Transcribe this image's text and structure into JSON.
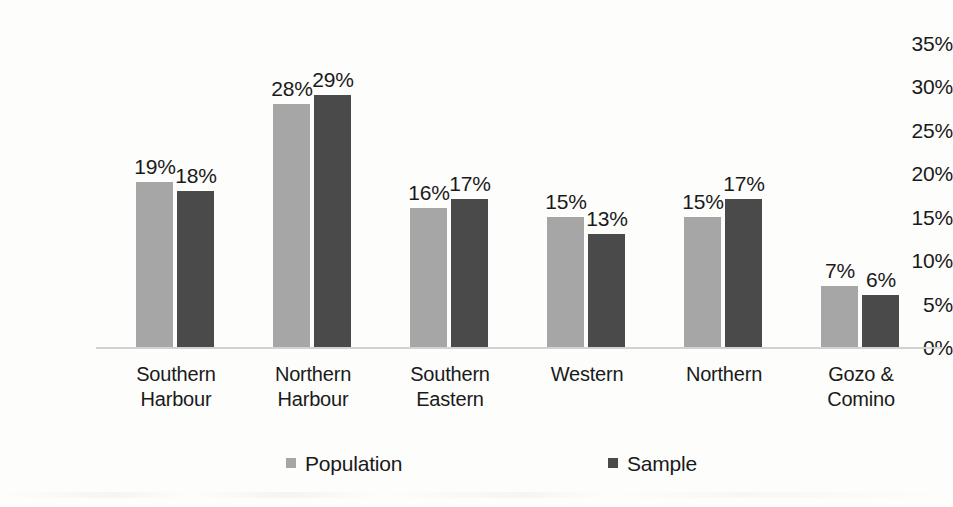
{
  "chart_data": {
    "type": "bar",
    "title": "",
    "subtitle": "",
    "xlabel": "",
    "ylabel": "",
    "ylim": [
      0,
      35
    ],
    "ytick_labels": [
      "35%",
      "30%",
      "25%",
      "20%",
      "15%",
      "10%",
      "5%",
      "0%"
    ],
    "ytick_values": [
      35,
      30,
      25,
      20,
      15,
      10,
      5,
      0
    ],
    "grid": false,
    "legend_position": "bottom",
    "categories": [
      "Southern Harbour",
      "Northern Harbour",
      "Southern Eastern",
      "Western",
      "Northern",
      "Gozo & Comino"
    ],
    "category_lines": [
      [
        "Southern",
        "Harbour"
      ],
      [
        "Northern",
        "Harbour"
      ],
      [
        "Southern",
        "Eastern"
      ],
      [
        "Western",
        ""
      ],
      [
        "Northern",
        ""
      ],
      [
        "Gozo &",
        "Comino"
      ]
    ],
    "series": [
      {
        "name": "Population",
        "color": "#a6a6a6",
        "values": [
          19,
          28,
          16,
          15,
          15,
          7
        ],
        "labels": [
          "19%",
          "28%",
          "16%",
          "15%",
          "15%",
          "7%"
        ]
      },
      {
        "name": "Sample",
        "color": "#4a4a4a",
        "values": [
          18,
          29,
          17,
          13,
          17,
          6
        ],
        "labels": [
          "18%",
          "29%",
          "17%",
          "13%",
          "17%",
          "6%"
        ]
      }
    ]
  },
  "legend": {
    "items": [
      {
        "label": "Population",
        "color": "#a6a6a6"
      },
      {
        "label": "Sample",
        "color": "#4a4a4a"
      }
    ]
  }
}
